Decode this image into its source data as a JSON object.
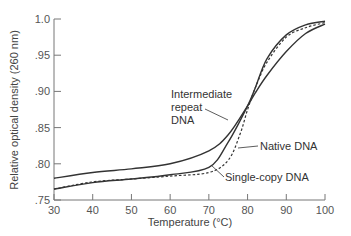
{
  "chart_data": {
    "type": "line",
    "title": "",
    "xlabel": "Temperature (°C)",
    "ylabel": "Relative optical density (260 nm)",
    "xlim": [
      30,
      100
    ],
    "ylim": [
      0.75,
      1.0
    ],
    "grid": false,
    "legend": "none (inline annotations)",
    "x_ticks": [
      "30",
      "40",
      "50",
      "60",
      "70",
      "80",
      "90",
      "100"
    ],
    "y_ticks": [
      ".75",
      ".80",
      ".85",
      ".90",
      ".95",
      "1.0"
    ],
    "series": [
      {
        "name": "Intermediate repeat DNA",
        "style": "solid",
        "x": [
          30,
          40,
          50,
          60,
          70,
          75,
          80,
          82,
          85,
          90,
          95,
          100
        ],
        "values": [
          0.78,
          0.788,
          0.793,
          0.8,
          0.818,
          0.84,
          0.88,
          0.898,
          0.922,
          0.955,
          0.98,
          0.993
        ]
      },
      {
        "name": "Native DNA",
        "style": "dashed",
        "x": [
          30,
          40,
          50,
          60,
          70,
          75,
          78,
          80,
          82,
          85,
          90,
          95,
          100
        ],
        "values": [
          0.765,
          0.775,
          0.779,
          0.783,
          0.788,
          0.805,
          0.84,
          0.875,
          0.905,
          0.94,
          0.975,
          0.988,
          0.995
        ]
      },
      {
        "name": "Single-copy DNA",
        "style": "solid",
        "x": [
          30,
          40,
          50,
          60,
          70,
          75,
          80,
          82,
          85,
          90,
          95,
          100
        ],
        "values": [
          0.765,
          0.774,
          0.779,
          0.785,
          0.795,
          0.83,
          0.88,
          0.905,
          0.945,
          0.978,
          0.992,
          0.997
        ]
      }
    ],
    "annotations": [
      {
        "text_lines": [
          "Intermediate",
          "repeat",
          "DNA"
        ],
        "target": "Intermediate repeat DNA"
      },
      {
        "text_lines": [
          "Native DNA"
        ],
        "target": "Native DNA"
      },
      {
        "text_lines": [
          "Single-copy DNA"
        ],
        "target": "Single-copy DNA"
      }
    ]
  },
  "labels": {
    "xlabel": "Temperature (°C)",
    "ylabel": "Relative optical density (260 nm)",
    "annot_intermediate_1": "Intermediate",
    "annot_intermediate_2": "repeat",
    "annot_intermediate_3": "DNA",
    "annot_native": "Native DNA",
    "annot_single": "Single-copy DNA"
  },
  "colors": {
    "line": "#333333",
    "axis": "#777777"
  }
}
